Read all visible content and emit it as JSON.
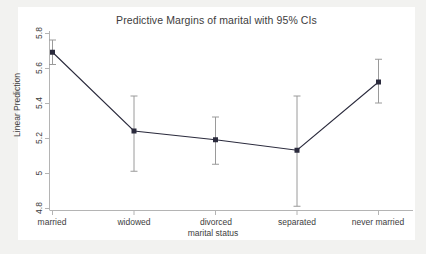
{
  "chart_data": {
    "type": "line",
    "title": "Predictive Margins of marital with 95% CIs",
    "xlabel": "marital status",
    "ylabel": "Linear Prediction",
    "categories": [
      "married",
      "widowed",
      "divorced",
      "separated",
      "never married"
    ],
    "values": [
      5.69,
      5.24,
      5.19,
      5.13,
      5.52
    ],
    "ci_lower": [
      5.62,
      5.01,
      5.05,
      4.81,
      5.4
    ],
    "ci_upper": [
      5.76,
      5.44,
      5.32,
      5.44,
      5.65
    ],
    "ylim": [
      4.8,
      5.8
    ],
    "yticks": [
      "4.8",
      "5",
      "5.2",
      "5.4",
      "5.6",
      "5.8"
    ],
    "ytick_values": [
      4.8,
      5.0,
      5.2,
      5.4,
      5.6,
      5.8
    ],
    "grid": false,
    "legend": "none",
    "marker": "square",
    "series_color": "#2b2b3d",
    "error_bar_color": "#9a9a9a",
    "axis_color": "#b4b4b4",
    "background": "#ffffff",
    "figure_background": "#f2f2f0"
  }
}
